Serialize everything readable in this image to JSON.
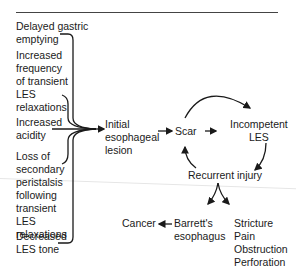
{
  "diagram": {
    "causes": [
      {
        "id": "delayed-gastric-emptying",
        "label": "Delayed gastric\nemptying"
      },
      {
        "id": "transient-les-relaxations",
        "label": "Increased\nfrequency\nof transient\nLES\nrelaxations"
      },
      {
        "id": "increased-acidity",
        "label": "Increased\nacidity"
      },
      {
        "id": "loss-secondary-peristalsis",
        "label": "Loss of\nsecondary\nperistalsis\nfollowing\ntransient\nLES\nrelaxations"
      },
      {
        "id": "decreased-les-tone",
        "label": "Decreased\nLES tone"
      }
    ],
    "nodes": {
      "initial_lesion": "Initial\nesophageal\nlesion",
      "scar": "Scar",
      "incompetent_les": "Incompetent\nLES",
      "recurrent_injury": "Recurrent injury",
      "barretts": "Barrett's\nesophagus",
      "cancer": "Cancer",
      "complications": "Stricture\nPain\nObstruction\nPerforation"
    },
    "edges": [
      [
        "causes",
        "initial_lesion"
      ],
      [
        "initial_lesion",
        "scar"
      ],
      [
        "scar",
        "incompetent_les"
      ],
      [
        "incompetent_les",
        "recurrent_injury"
      ],
      [
        "recurrent_injury",
        "scar"
      ],
      [
        "recurrent_injury",
        "barretts"
      ],
      [
        "recurrent_injury",
        "complications"
      ],
      [
        "barretts",
        "cancer"
      ]
    ],
    "colors": {
      "ink": "#1a1a1a",
      "rule": "#444444"
    }
  }
}
